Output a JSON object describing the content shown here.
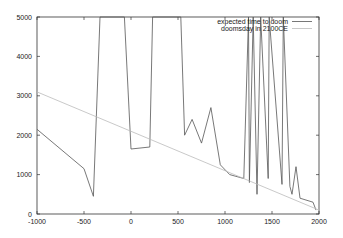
{
  "chart_data": {
    "type": "line",
    "title": "",
    "xlabel": "",
    "ylabel": "",
    "xlim": [
      -1000,
      2000
    ],
    "ylim": [
      0,
      5000
    ],
    "x_ticks": [
      "-1000",
      "-500",
      "0",
      "500",
      "1000",
      "1500",
      "2000"
    ],
    "y_ticks": [
      "0",
      "1000",
      "2000",
      "3000",
      "4000",
      "5000"
    ],
    "grid": false,
    "legend_position": "top-right",
    "series": [
      {
        "name": "expected time to doom",
        "color": "#555555",
        "points": [
          [
            -1000,
            2150
          ],
          [
            -500,
            1150
          ],
          [
            -400,
            450
          ],
          [
            -330,
            5000
          ],
          [
            -70,
            5000
          ],
          [
            0,
            1650
          ],
          [
            200,
            1700
          ],
          [
            230,
            5000
          ],
          [
            530,
            5000
          ],
          [
            570,
            2000
          ],
          [
            650,
            2400
          ],
          [
            750,
            1800
          ],
          [
            850,
            2700
          ],
          [
            950,
            1250
          ],
          [
            1050,
            1000
          ],
          [
            1200,
            900
          ],
          [
            1250,
            5000
          ],
          [
            1260,
            800
          ],
          [
            1300,
            5000
          ],
          [
            1340,
            500
          ],
          [
            1380,
            5000
          ],
          [
            1460,
            900
          ],
          [
            1470,
            5000
          ],
          [
            1606,
            750
          ],
          [
            1620,
            5000
          ],
          [
            1690,
            700
          ],
          [
            1713,
            500
          ],
          [
            1755,
            1200
          ],
          [
            1798,
            400
          ],
          [
            1936,
            300
          ],
          [
            1968,
            100
          ]
        ]
      },
      {
        "name": "doomsday in 2100CE",
        "color": "#bbbbbb",
        "points": [
          [
            -1000,
            3100
          ],
          [
            2000,
            100
          ]
        ]
      }
    ]
  },
  "legend": {
    "items": [
      "expected time to doom",
      "doomsday in 2100CE"
    ]
  }
}
